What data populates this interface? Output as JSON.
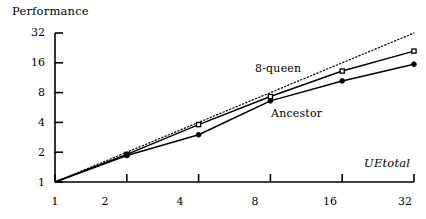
{
  "chart_data": {
    "type": "line",
    "title": "",
    "xlabel": "UEtotal",
    "ylabel": "Performance",
    "xscale": "log2",
    "yscale": "log2",
    "xlim": [
      1,
      32
    ],
    "ylim": [
      1,
      32
    ],
    "grid": false,
    "legend_position": "inline-annotations",
    "x_ticks": [
      "1",
      "2",
      "4",
      "8",
      "16",
      "32"
    ],
    "y_ticks": [
      "1",
      "2",
      "4",
      "8",
      "16",
      "32"
    ],
    "x": [
      1,
      2,
      4,
      8,
      16,
      32
    ],
    "series": [
      {
        "name": "ideal",
        "label": "",
        "style": "dotted",
        "marker": "none",
        "values": [
          1,
          2,
          4,
          8,
          16,
          32
        ]
      },
      {
        "name": "8-queen",
        "label": "8-queen",
        "style": "solid",
        "marker": "square",
        "values": [
          1,
          1.9,
          3.8,
          7.3,
          13.2,
          21.0
        ]
      },
      {
        "name": "Ancestor",
        "label": "Ancestor",
        "style": "solid",
        "marker": "circle",
        "values": [
          1,
          1.85,
          3.0,
          6.6,
          10.5,
          15.5
        ]
      }
    ],
    "annotations": [
      {
        "text": "8-queen",
        "x": 9.5,
        "y": 11.5
      },
      {
        "text": "Ancestor",
        "x": 11.5,
        "y": 4.4
      }
    ],
    "colors": {
      "axis": "#000000",
      "ideal": "#000000",
      "8-queen": "#000000",
      "Ancestor": "#000000",
      "background": "#ffffff"
    }
  },
  "axes": {
    "y_title": "Performance",
    "x_title": "UEtotal",
    "y_tick_labels": [
      "32",
      "16",
      "8",
      "4",
      "2",
      "1"
    ],
    "x_tick_labels": [
      "1",
      "2",
      "4",
      "8",
      "16",
      "32"
    ]
  },
  "labels": {
    "queen": "8-queen",
    "ancestor": "Ancestor"
  }
}
